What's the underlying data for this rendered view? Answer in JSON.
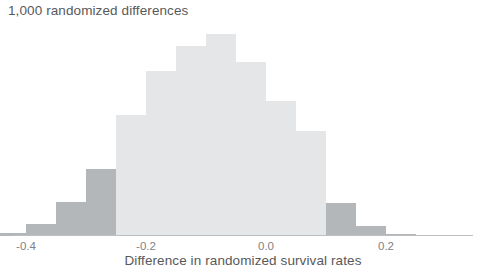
{
  "chart_data": {
    "type": "bar",
    "title": "1,000 randomized differences",
    "subtitle": "",
    "xlabel": "Difference in randomized survival rates",
    "ylabel": "",
    "xlim": [
      -0.425,
      0.275
    ],
    "ylim": [
      0,
      230
    ],
    "grid": false,
    "legend": null,
    "bin_width": 0.05,
    "tick_labels": [
      "-0.4",
      "-0.2",
      "0.0",
      "0.2"
    ],
    "tick_values": [
      -0.4,
      -0.2,
      0.0,
      0.2
    ],
    "categories": [
      "-0.425",
      "-0.375",
      "-0.325",
      "-0.275",
      "-0.225",
      "-0.175",
      "-0.125",
      "-0.075",
      "-0.025",
      "0.025",
      "0.075",
      "0.125",
      "0.175",
      "0.225"
    ],
    "bin_centers": [
      -0.425,
      -0.375,
      -0.325,
      -0.275,
      -0.225,
      -0.175,
      -0.125,
      -0.075,
      -0.025,
      0.025,
      0.075,
      0.125,
      0.175,
      0.225
    ],
    "values": [
      3,
      14,
      38,
      76,
      137,
      186,
      215,
      228,
      196,
      152,
      119,
      37,
      11,
      2
    ],
    "bar_shades": [
      "dark",
      "dark",
      "dark",
      "dark",
      "light",
      "light",
      "light",
      "light",
      "light",
      "light",
      "light",
      "dark",
      "dark",
      "dark"
    ],
    "colors": {
      "bar_light": "#e4e6e8",
      "bar_dark": "#b4b7b9",
      "axis": "#bcbec0",
      "title_text": "#58595b",
      "tick_text": "#808285",
      "background": "#ffffff"
    }
  }
}
